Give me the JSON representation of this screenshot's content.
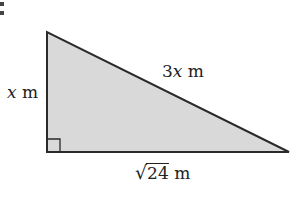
{
  "figure": {
    "type": "right-triangle",
    "fill_color": "#d9d9d9",
    "stroke_color": "#2a2a2a",
    "vertices": {
      "top": [
        47,
        32
      ],
      "bottom_left": [
        47,
        152
      ],
      "bottom_right": [
        289,
        152
      ]
    },
    "right_angle_marker": {
      "corner": "bottom_left",
      "size": 13
    },
    "labels": {
      "left_side": {
        "var": "x",
        "unit": "m"
      },
      "hypotenuse": {
        "coef": "3",
        "var": "x",
        "unit": "m"
      },
      "bottom_side": {
        "radical": "√",
        "radicand": "24",
        "unit": "m"
      }
    },
    "partial_glyph": ":"
  }
}
